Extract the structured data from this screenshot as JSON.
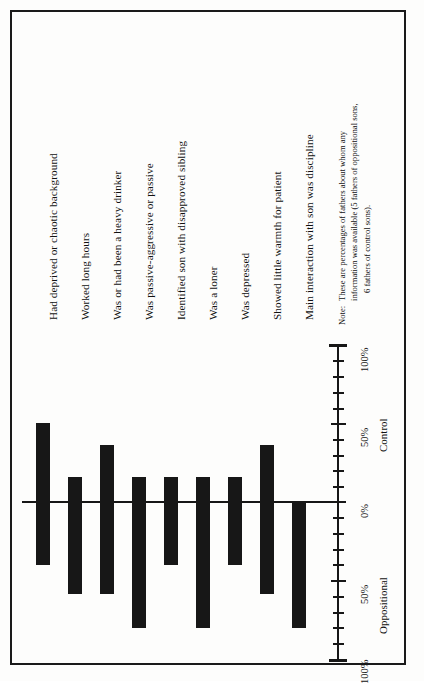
{
  "figure": {
    "orientation": "rotated-90",
    "note_label": "Note:",
    "note_lines": [
      "These are percentages of fathers about whom any",
      "information was available (5 fathers of oppositional sons,",
      "6 fathers of control sons)."
    ],
    "note_full": "Note: These are percentages of fathers about whom any information was available (5 fathers of oppositional sons, 6 fathers of control sons).",
    "frame_color": "#1a1a1a",
    "bar_color": "#171717",
    "background": "#fdfdfc"
  },
  "axis": {
    "group_left": "Oppositional",
    "group_right": "Control",
    "tick_labels": [
      "100%",
      "50%",
      "0%",
      "50%",
      "100%"
    ],
    "tick_values": [
      -100,
      -50,
      0,
      50,
      100
    ],
    "minor_step": 10,
    "range": [
      -100,
      100
    ]
  },
  "chart_data": {
    "type": "bar",
    "title": "",
    "subtitle": "",
    "xlabel": "",
    "ylabel": "",
    "ylim": [
      -100,
      100
    ],
    "grid": false,
    "legend": "none",
    "orientation": "diverging-vertical",
    "positive_group": "Control",
    "negative_group": "Oppositional",
    "categories": [
      "Had deprived or chaotic background",
      "Worked long hours",
      "Was or had been a heavy drinker",
      "Was passive-aggressive or passive",
      "Identified son with disapproved sibling",
      "Was a loner",
      "Was depressed",
      "Showed little warmth for patient",
      "Main interaction with son was discipline"
    ],
    "series": [
      {
        "name": "Control",
        "values": [
          50,
          16,
          36,
          16,
          16,
          16,
          16,
          36,
          0
        ]
      },
      {
        "name": "Oppositional",
        "values": [
          40,
          58,
          58,
          80,
          40,
          80,
          40,
          58,
          80
        ]
      }
    ],
    "net_values": [
      50,
      16,
      36,
      16,
      16,
      16,
      16,
      36,
      0
    ]
  },
  "labels": {
    "items": [
      {
        "text": "Had deprived or chaotic background"
      },
      {
        "text": "Worked long hours"
      },
      {
        "text": "Was or had been a heavy drinker"
      },
      {
        "text": "Was passive-aggressive or passive"
      },
      {
        "text": "Identified son with disapproved sibling"
      },
      {
        "text": "Was a loner"
      },
      {
        "text": "Was depressed"
      },
      {
        "text": "Showed little warmth for patient"
      },
      {
        "text": "Main interaction with son was discipline"
      }
    ]
  }
}
